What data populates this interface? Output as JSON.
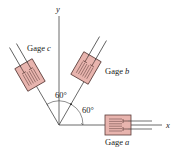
{
  "diagram": {
    "type": "strain-gage-rosette",
    "axes": {
      "x_label": "x",
      "y_label": "y"
    },
    "gages": [
      {
        "id": "a",
        "label_prefix": "Gage",
        "label_letter": "a",
        "angle_deg": 0
      },
      {
        "id": "b",
        "label_prefix": "Gage",
        "label_letter": "b",
        "angle_deg": 60
      },
      {
        "id": "c",
        "label_prefix": "Gage",
        "label_letter": "c",
        "angle_deg": 120
      }
    ],
    "angle_labels": {
      "between_x_and_b": "60°",
      "between_b_and_c": "60°"
    },
    "colors": {
      "gage_fill": "#e8b4ae",
      "gage_stroke": "#5a3b38",
      "line": "#333333"
    }
  }
}
